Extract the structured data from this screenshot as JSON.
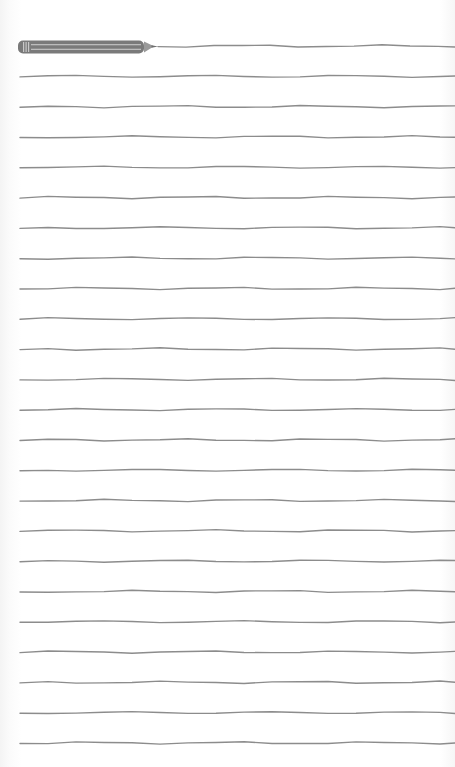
{
  "page": {
    "type": "lined-notebook-paper",
    "background_color": "#ffffff",
    "ghost_text": ""
  },
  "rules": {
    "count": 24,
    "first_y": 46,
    "spacing": 30.3,
    "left_x": 20,
    "right_x": 455,
    "color": "#8c8c8c",
    "thickness": 1.4
  },
  "pencil": {
    "icon": "pencil-icon",
    "body_color": "#7a7a7a",
    "stripe_color": "#d9d9d9",
    "band_color": "#c8c8c8"
  }
}
